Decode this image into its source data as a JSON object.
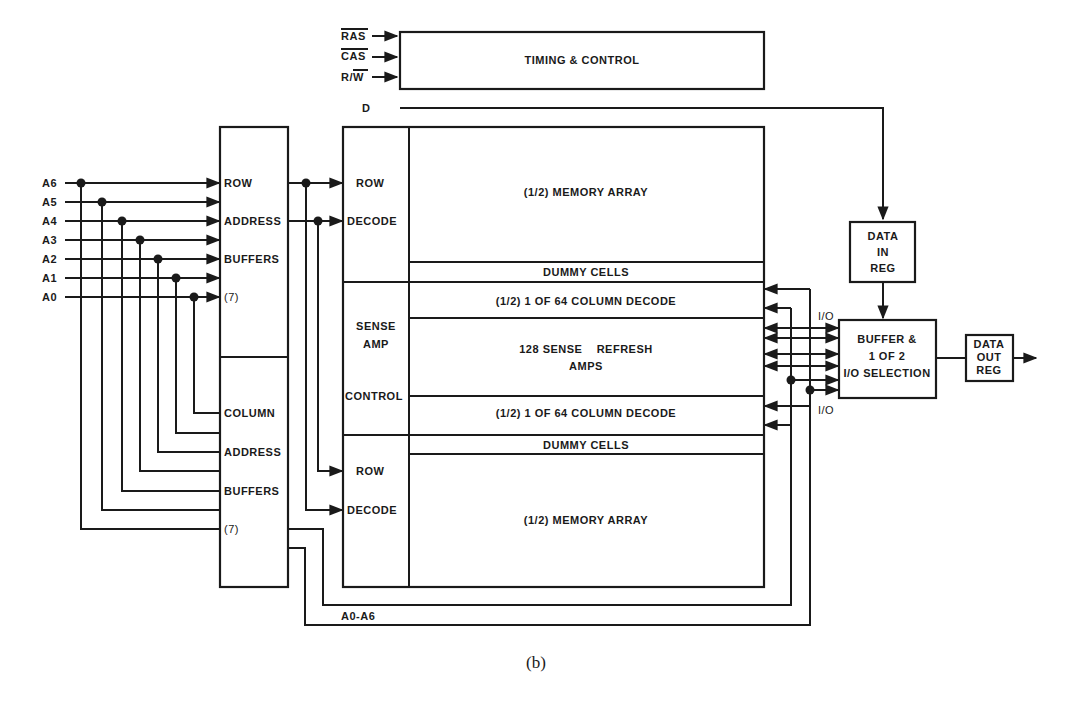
{
  "caption": "(b)",
  "inputs": {
    "ras": "RAS",
    "cas": "CAS",
    "rw": "R/W",
    "d": "D"
  },
  "address_pins": [
    "A6",
    "A5",
    "A4",
    "A3",
    "A2",
    "A1",
    "A0"
  ],
  "timing_control": {
    "label": "TIMING & CONTROL"
  },
  "row_address_buffers": {
    "line1": "ROW",
    "line2": "ADDRESS",
    "line3": "BUFFERS",
    "count": "(7)"
  },
  "column_address_buffers": {
    "line1": "COLUMN",
    "line2": "ADDRESS",
    "line3": "BUFFERS",
    "count": "(7)"
  },
  "row_decode_top": {
    "line1": "ROW",
    "line2": "DECODE"
  },
  "row_decode_bottom": {
    "line1": "ROW",
    "line2": "DECODE"
  },
  "sense_amp_control": {
    "line1": "SENSE",
    "line2": "AMP",
    "line3": "CONTROL"
  },
  "array": {
    "top_memory": "(1/2) MEMORY ARRAY",
    "top_dummy": "DUMMY CELLS",
    "top_column_decode": "(1/2) 1 OF 64 COLUMN DECODE",
    "sense_line1": "128 SENSE    REFRESH",
    "sense_line2": "AMPS",
    "bottom_column_decode": "(1/2) 1 OF 64 COLUMN DECODE",
    "bottom_dummy": "DUMMY CELLS",
    "bottom_memory": "(1/2) MEMORY ARRAY"
  },
  "data_in_reg": {
    "line1": "DATA",
    "line2": "IN",
    "line3": "REG"
  },
  "io_selection": {
    "line1": "BUFFER &",
    "line2": "1 OF 2",
    "line3": "I/O SELECTION"
  },
  "data_out_reg": {
    "line1": "DATA",
    "line2": "OUT",
    "line3": "REG"
  },
  "bus_labels": {
    "io_top": "I/O",
    "io_bottom": "I/O",
    "address_bus": "A0-A6"
  }
}
